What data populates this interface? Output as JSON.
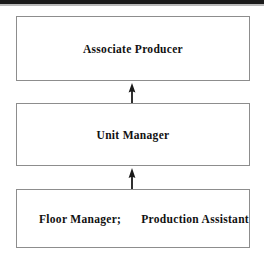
{
  "diagram": {
    "type": "hierarchy-flow",
    "orientation": "vertical-bottom-up",
    "title": "",
    "nodes": [
      {
        "id": "associate-producer",
        "label": "Associate Producer",
        "level": 1
      },
      {
        "id": "unit-manager",
        "label": "Unit Manager",
        "level": 2
      },
      {
        "id": "floor-production",
        "label_left": "Floor Manager;",
        "label_right": "Production Assistant",
        "level": 3
      }
    ],
    "edges": [
      {
        "id": "unit-to-associate",
        "from": "unit-manager",
        "to": "associate-producer",
        "arrow": "up-arrow-icon"
      },
      {
        "id": "floor-to-unit",
        "from": "floor-production",
        "to": "unit-manager",
        "arrow": "up-arrow-icon"
      }
    ],
    "colors": {
      "box_border": "#8d8d8d",
      "box_fill": "#ffffff",
      "text": "#111111",
      "arrow": "#1a1a1a",
      "page_background": "#ffffff",
      "top_band": "#1a1a1a"
    }
  }
}
